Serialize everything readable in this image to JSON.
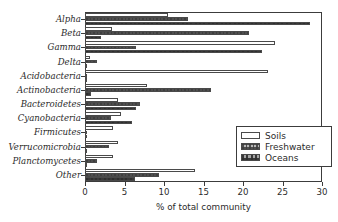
{
  "chart_data": {
    "type": "bar",
    "orientation": "horizontal",
    "title": "",
    "xlabel": "% of total community",
    "ylabel": "",
    "xlim": [
      0,
      30
    ],
    "xticks": [
      0,
      5,
      10,
      15,
      20,
      25,
      30
    ],
    "grid": false,
    "legend_position": "lower-right",
    "categories": [
      "Alpha",
      "Beta",
      "Gamma",
      "Delta",
      "Acidobacteria",
      "Actinobacteria",
      "Bacteroidetes",
      "Cyanobacteria",
      "Firmicutes",
      "Verrucomicrobia",
      "Planctomycetes",
      "Other"
    ],
    "series": [
      {
        "name": "Soils",
        "pattern": "open",
        "values": [
          10.5,
          3.4,
          24.0,
          0.6,
          23.2,
          7.8,
          4.2,
          4.5,
          3.6,
          4.2,
          3.5,
          13.9
        ]
      },
      {
        "name": "Freshwater",
        "pattern": "dotted",
        "values": [
          13.0,
          20.8,
          6.5,
          1.5,
          0.1,
          16.0,
          7.0,
          3.3,
          0.3,
          3.1,
          1.5,
          9.4
        ]
      },
      {
        "name": "Oceans",
        "pattern": "dotted-dark",
        "values": [
          28.5,
          2.0,
          22.4,
          0.3,
          0.1,
          0.7,
          6.4,
          6.0,
          0.2,
          0.1,
          0.2,
          6.3
        ]
      }
    ]
  },
  "legend": {
    "items": [
      {
        "label": "Soils"
      },
      {
        "label": "Freshwater"
      },
      {
        "label": "Oceans"
      }
    ]
  },
  "colors": {
    "axis": "#3c3c3c",
    "text": "#2b2b2b",
    "soils_fill": "#ffffff",
    "freshwater_fill": "#b8b8b8",
    "oceans_fill": "#a6a6a6"
  }
}
